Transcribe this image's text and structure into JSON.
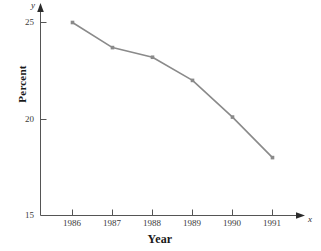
{
  "chart_data": {
    "type": "line",
    "title": "",
    "xlabel": "Year",
    "ylabel": "Percent",
    "x_axis_variable": "x",
    "y_axis_variable": "y",
    "categories": [
      "1986",
      "1987",
      "1988",
      "1989",
      "1990",
      "1991"
    ],
    "values": [
      25.0,
      23.7,
      23.2,
      22.0,
      20.1,
      18.0
    ],
    "series": [
      {
        "name": "Percent",
        "values": [
          25.0,
          23.7,
          23.2,
          22.0,
          20.1,
          18.0
        ]
      }
    ],
    "x_tick_labels": [
      "1986",
      "1987",
      "1988",
      "1989",
      "1990",
      "1991"
    ],
    "y_tick_labels": [
      "25",
      "20",
      "15"
    ],
    "ylim": [
      15,
      25
    ],
    "yticks": [
      15,
      20,
      25
    ],
    "grid": false,
    "legend": false,
    "legend_position": "none",
    "line_color": "#8a8a8a",
    "marker_color": "#8a8a8a",
    "marker": "square",
    "axis_color": "#555555",
    "axis_style": "arrow-ended"
  },
  "axes": {
    "y_ticks": [
      {
        "label": "25",
        "value": 25
      },
      {
        "label": "20",
        "value": 20
      },
      {
        "label": "15",
        "value": 15
      }
    ],
    "x_ticks": [
      {
        "label": "1986"
      },
      {
        "label": "1987"
      },
      {
        "label": "1988"
      },
      {
        "label": "1989"
      },
      {
        "label": "1990"
      },
      {
        "label": "1991"
      }
    ],
    "x_variable": "x",
    "y_variable": "y",
    "x_title": "Year",
    "y_title": "Percent"
  }
}
